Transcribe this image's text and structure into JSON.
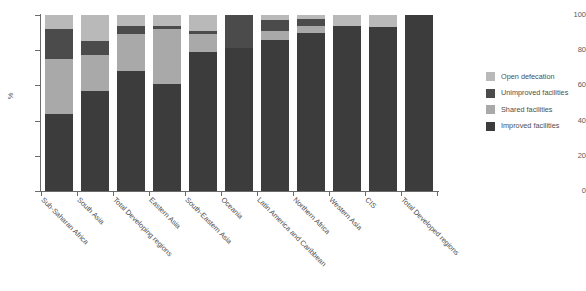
{
  "chart_data": {
    "type": "bar",
    "title": "",
    "subtitle": "",
    "xlabel": "",
    "ylabel": "%",
    "ylim": [
      0,
      100
    ],
    "yticks": [
      0,
      20,
      40,
      60,
      80,
      100
    ],
    "grid": false,
    "stacked": true,
    "stack_total": 100,
    "legend_position": "right",
    "orientation": "vertical",
    "categories": [
      "Sub-Saharan Africa",
      "South Asia",
      "Total Developing regions",
      "Eastern Asia",
      "South-Eastern Asia",
      "Oceania",
      "Latin America and Caribbean",
      "Northern Africa",
      "Western Asia",
      "CIS",
      "Total Developed regions"
    ],
    "series": [
      {
        "name": "Improved facilities",
        "color": "#3c3c3c",
        "values": [
          44,
          57,
          68,
          61,
          79,
          81,
          86,
          90,
          94,
          93,
          100
        ]
      },
      {
        "name": "Shared facilities",
        "color": "#a9a9a9",
        "values": [
          31,
          20,
          21,
          31,
          10,
          0,
          5,
          4,
          0,
          0,
          0
        ]
      },
      {
        "name": "Unimproved facilities",
        "color": "#4b4b4b",
        "values": [
          17,
          8,
          5,
          2,
          2,
          19,
          6,
          4,
          0,
          0,
          0
        ]
      },
      {
        "name": "Open defecation",
        "color": "#b9b9b9",
        "values": [
          8,
          15,
          6,
          6,
          9,
          0,
          3,
          2,
          6,
          7,
          0
        ]
      }
    ]
  },
  "legend": {
    "items": [
      {
        "label": "Open defecation",
        "color": "#b9b9b9"
      },
      {
        "label": "Unimproved facilities",
        "color": "#4b4b4b"
      },
      {
        "label": "Shared facilities",
        "color": "#a9a9a9"
      },
      {
        "label": "Improved facilities",
        "color": "#3c3c3c"
      }
    ]
  }
}
